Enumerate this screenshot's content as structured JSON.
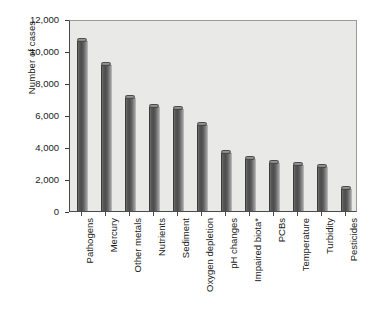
{
  "chart_data": {
    "type": "bar",
    "title": "",
    "subtitle": "",
    "xlabel": "",
    "ylabel": "Number of cases",
    "categories": [
      "Pathogens",
      "Mercury",
      "Other metals",
      "Nutrients",
      "Sediment",
      "Oxygen depletion",
      "pH changes",
      "Impaired biota*",
      "PCBs",
      "Temperature",
      "Turbidity",
      "Pesticides"
    ],
    "values": [
      10600,
      9100,
      7050,
      6500,
      6400,
      5400,
      3600,
      3250,
      3000,
      2900,
      2750,
      1350
    ],
    "ylim": [
      0,
      12000
    ],
    "ytick_values": [
      0,
      2000,
      4000,
      6000,
      8000,
      10000,
      12000
    ],
    "ytick_labels": [
      "0",
      "2,000",
      "4,000",
      "6,000",
      "8,000",
      "10,000",
      "12,000"
    ],
    "grid": false,
    "legend": null,
    "legend_position": "none",
    "annotations": [],
    "colors": {
      "bar_fill": "#565656",
      "bar_edge": "#3c3c3c",
      "plot_background": "#e9e9e7",
      "axis": "#4a4a4a",
      "text": "#1a1a1a",
      "figure_background": "#ffffff"
    }
  }
}
